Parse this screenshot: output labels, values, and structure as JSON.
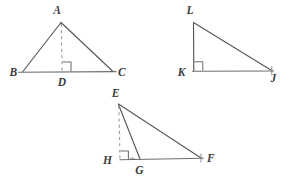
{
  "figure": {
    "background_color": "#ffffff",
    "line_color": "#58585a",
    "dashed_line_color": "#9a9b9d",
    "label_color": "#3b3c3e",
    "triangles": [
      {
        "name": "triangle-abc",
        "vertex_labels": [
          "A",
          "B",
          "C"
        ],
        "foot_label": "D",
        "altitude_style": "dashed",
        "altitude_from": "A",
        "altitude_to": "D",
        "right_angle_at": "D",
        "right_angle_interior": true
      },
      {
        "name": "triangle-lkj",
        "vertex_labels": [
          "L",
          "K",
          "J"
        ],
        "foot_label": "K",
        "altitude_style": "solid-leg",
        "altitude_from": "L",
        "altitude_to": "K",
        "right_angle_at": "K",
        "right_angle_interior": true
      },
      {
        "name": "triangle-egf",
        "vertex_labels": [
          "E",
          "G",
          "F"
        ],
        "foot_label": "H",
        "altitude_style": "dashed",
        "altitude_from": "E",
        "altitude_to": "H",
        "right_angle_at": "H",
        "right_angle_interior": false
      }
    ],
    "labels": {
      "a": "A",
      "b": "B",
      "c": "C",
      "d": "D",
      "l": "L",
      "k": "K",
      "j": "J",
      "e": "E",
      "f": "F",
      "g": "G",
      "h": "H"
    }
  }
}
